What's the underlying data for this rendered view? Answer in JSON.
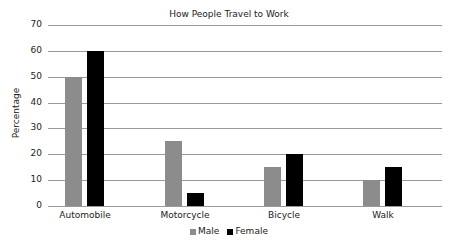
{
  "chart_data": {
    "type": "bar",
    "title": "How People Travel to Work",
    "xlabel": "",
    "ylabel": "Percentage",
    "ylim": [
      0,
      70
    ],
    "yticks": [
      "0",
      "10",
      "20",
      "30",
      "40",
      "50",
      "60",
      "70"
    ],
    "grid": true,
    "legend_position": "bottom",
    "categories": [
      "Automobile",
      "Motorcycle",
      "Bicycle",
      "Walk"
    ],
    "series": [
      {
        "name": "Male",
        "color": "#8c8c8c",
        "values": [
          50,
          25,
          15,
          10
        ]
      },
      {
        "name": "Female",
        "color": "#000000",
        "values": [
          60,
          5,
          20,
          15
        ]
      }
    ]
  }
}
